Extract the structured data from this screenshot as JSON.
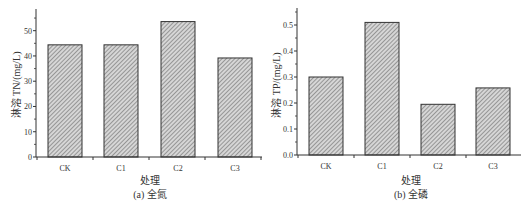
{
  "chart_data": [
    {
      "type": "bar",
      "title": "",
      "caption": "(a) 全氮",
      "xlabel": "处理",
      "ylabel": "淋溶 TN/(mg/L)",
      "categories": [
        "CK",
        "C1",
        "C2",
        "C3"
      ],
      "values": [
        44.4,
        44.4,
        53.6,
        39.2
      ],
      "ylim": [
        0,
        57
      ],
      "yticks": [
        0,
        10,
        20,
        30,
        40,
        50
      ],
      "ytick_labels": [
        "0",
        "10",
        "20",
        "30",
        "40",
        "50"
      ],
      "grid": false,
      "bar_fill": "diagonal-hatch",
      "bar_color": "#bdbdbd",
      "legend": null
    },
    {
      "type": "bar",
      "title": "",
      "caption": "(b) 全磷",
      "xlabel": "处理",
      "ylabel": "淋溶 TP/(mg/L)",
      "categories": [
        "CK",
        "C1",
        "C2",
        "C3"
      ],
      "values": [
        0.3,
        0.51,
        0.195,
        0.258
      ],
      "ylim": [
        0,
        0.55
      ],
      "yticks": [
        0.0,
        0.1,
        0.2,
        0.3,
        0.4,
        0.5
      ],
      "ytick_labels": [
        "0.0",
        "0.1",
        "0.2",
        "0.3",
        "0.4",
        "0.5"
      ],
      "grid": false,
      "bar_fill": "diagonal-hatch",
      "bar_color": "#bdbdbd",
      "legend": null
    }
  ]
}
